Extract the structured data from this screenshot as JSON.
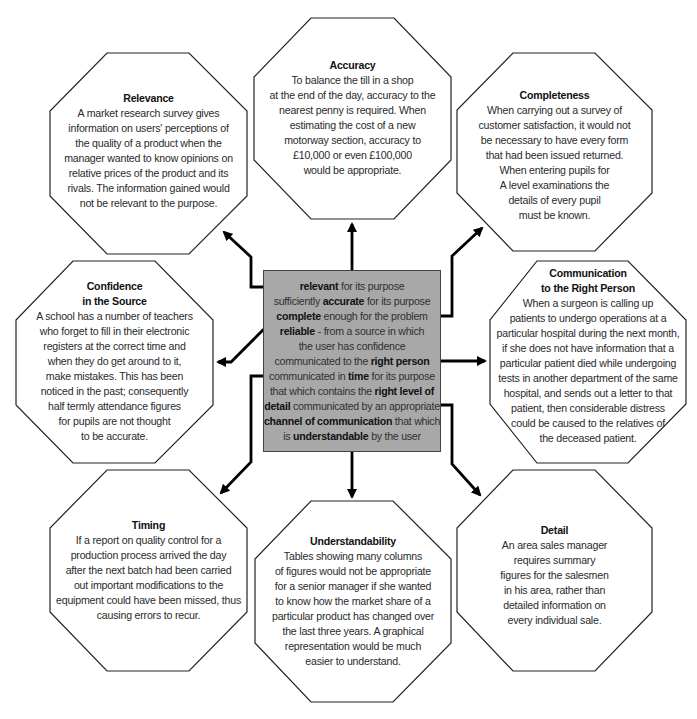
{
  "diagram": {
    "type": "hub-and-spoke",
    "center": {
      "fill_color": "#a8a8a8",
      "lines": [
        {
          "bold": "relevant",
          "rest": " for its purpose",
          "prefix": ""
        },
        {
          "prefix": "sufficiently ",
          "bold": "accurate",
          "rest": " for its purpose"
        },
        {
          "prefix": "",
          "bold": "complete",
          "rest": " enough for the problem"
        },
        {
          "prefix": "",
          "bold": "reliable",
          "rest": " - from a source in which"
        },
        {
          "prefix": "the user has confidence",
          "bold": "",
          "rest": ""
        },
        {
          "prefix": "communicated to the ",
          "bold": "right person",
          "rest": ""
        },
        {
          "prefix": "communicated in ",
          "bold": "time",
          "rest": " for its purpose"
        },
        {
          "prefix": "that which contains the ",
          "bold": "right level of",
          "rest": ""
        },
        {
          "prefix": "",
          "bold": "detail",
          "rest": " communicated by an appropriate"
        },
        {
          "prefix": "",
          "bold": "channel of communication",
          "rest": " that which"
        },
        {
          "prefix": "is ",
          "bold": "understandable",
          "rest": " by the user"
        }
      ]
    },
    "nodes": {
      "relevance": {
        "title": "Relevance",
        "lines": [
          "A market research survey gives",
          "information on users' perceptions of",
          "the quality of a product when the",
          "manager wanted to know opinions on",
          "relative prices of the product and its",
          "rivals. The information gained would",
          "not be relevant to the purpose."
        ]
      },
      "accuracy": {
        "title": "Accuracy",
        "lines": [
          "To balance the till in a shop",
          "at the end of the day, accuracy to the",
          "nearest penny is required. When",
          "estimating the cost of a new",
          "motorway section, accuracy to",
          "£10,000 or even £100,000",
          "would be appropriate."
        ]
      },
      "completeness": {
        "title": "Completeness",
        "lines": [
          "When carrying out a survey of",
          "customer satisfaction, it would not",
          "be necessary to have every form",
          "that had been issued returned.",
          "When entering pupils for",
          "A level examinations the",
          "details of every pupil",
          "must be known."
        ]
      },
      "confidence": {
        "title_lines": [
          "Confidence",
          "in the Source"
        ],
        "lines": [
          "A school has a number of teachers",
          "who forget to fill in their electronic",
          "registers at the correct time and",
          "when they do get around to it,",
          "make mistakes. This has been",
          "noticed in the past; consequently",
          "half termly attendance figures",
          "for pupils are not thought",
          "to be accurate."
        ]
      },
      "right_person": {
        "title_lines": [
          "Communication",
          "to the Right Person"
        ],
        "lines": [
          "When a surgeon is calling up",
          "patients to undergo operations at a",
          "particular hospital during the next month,",
          "if she does not have information that a",
          "particular patient died while undergoing",
          "tests in another department of the same",
          "hospital, and sends out a letter to that",
          "patient, then considerable distress",
          "could be caused to the relatives of",
          "the deceased patient."
        ]
      },
      "timing": {
        "title": "Timing",
        "lines": [
          "If a report on quality control for a",
          "production process arrived the day",
          "after the next batch had been carried",
          "out important modifications to the",
          "equipment could have been missed, thus",
          "causing errors to recur."
        ]
      },
      "understandability": {
        "title": "Understandability",
        "lines": [
          "Tables showing many columns",
          "of figures would not be appropriate",
          "for a senior manager if she wanted",
          "to know how the market share of a",
          "particular product has changed over",
          "the last three years. A graphical",
          "representation would be much",
          "easier to understand."
        ]
      },
      "detail": {
        "title": "Detail",
        "lines": [
          "An area sales manager",
          "requires summary",
          "figures for the salesmen",
          "in his area, rather than",
          "detailed information on",
          "every individual sale."
        ]
      }
    }
  }
}
